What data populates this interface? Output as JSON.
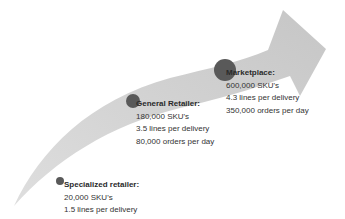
{
  "colors": {
    "arrow_fill": "#cfcfcf",
    "dot_fill": "#595959",
    "text": "#333333",
    "background": "#ffffff"
  },
  "stages": [
    {
      "title": "Specialized retailer:",
      "skus": "20,000 SKU's",
      "lines": "1.5 lines per delivery",
      "orders": "5,000 orders per day"
    },
    {
      "title": "General Retailer:",
      "skus": "180,000 SKU's",
      "lines": "3.5 lines per delivery",
      "orders": "80,000 orders per day"
    },
    {
      "title": "Marketplace:",
      "skus": "600,000 SKU's",
      "lines": "4.3 lines per delivery",
      "orders": "350,000 orders per day"
    }
  ]
}
